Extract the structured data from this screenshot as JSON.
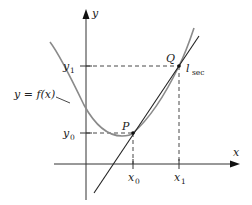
{
  "figure": {
    "axes": {
      "x_label": "x",
      "y_label": "y"
    },
    "curve": {
      "label": "y = f(x)",
      "color": "#8a8a8a"
    },
    "secant": {
      "label_main": "l",
      "label_sub": "sec",
      "color": "#222222"
    },
    "points": [
      {
        "name": "P",
        "x_label": "x0",
        "y_label": "y0"
      },
      {
        "name": "Q",
        "x_label": "x1",
        "y_label": "y1"
      }
    ],
    "tick_labels": {
      "x0_main": "x",
      "x0_sub": "0",
      "x1_main": "x",
      "x1_sub": "1",
      "y0_main": "y",
      "y0_sub": "0",
      "y1_main": "y",
      "y1_sub": "1"
    },
    "point_labels": {
      "P": "P",
      "Q": "Q"
    }
  }
}
